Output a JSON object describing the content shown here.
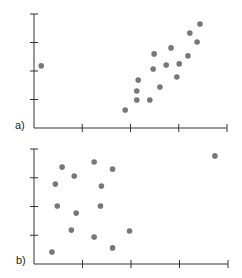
{
  "chart_data": [
    {
      "type": "scatter",
      "panel_label": "a)",
      "title": "",
      "xlabel": "",
      "ylabel": "",
      "xlim": [
        0,
        4
      ],
      "ylim": [
        0,
        4
      ],
      "x_ticks": [
        1,
        2,
        3,
        4
      ],
      "y_ticks": [
        1,
        2,
        3,
        4
      ],
      "tick_labels_shown": false,
      "grid": false,
      "legend": null,
      "point_color": "#777777",
      "points": [
        {
          "x": 0.15,
          "y": 2.18
        },
        {
          "x": 1.89,
          "y": 0.63
        },
        {
          "x": 2.13,
          "y": 0.98
        },
        {
          "x": 2.4,
          "y": 0.98
        },
        {
          "x": 2.13,
          "y": 1.3
        },
        {
          "x": 2.16,
          "y": 1.68
        },
        {
          "x": 2.61,
          "y": 1.44
        },
        {
          "x": 2.47,
          "y": 2.07
        },
        {
          "x": 2.49,
          "y": 2.6
        },
        {
          "x": 2.74,
          "y": 2.21
        },
        {
          "x": 2.84,
          "y": 2.81
        },
        {
          "x": 3.01,
          "y": 2.25
        },
        {
          "x": 2.96,
          "y": 1.79
        },
        {
          "x": 3.19,
          "y": 2.53
        },
        {
          "x": 3.23,
          "y": 3.33
        },
        {
          "x": 3.38,
          "y": 3.02
        },
        {
          "x": 3.44,
          "y": 3.65
        }
      ]
    },
    {
      "type": "scatter",
      "panel_label": "b)",
      "title": "",
      "xlabel": "",
      "ylabel": "",
      "xlim": [
        0,
        4
      ],
      "ylim": [
        0,
        4
      ],
      "x_ticks": [
        1,
        2,
        3,
        4
      ],
      "y_ticks": [
        1,
        2,
        3,
        4
      ],
      "tick_labels_shown": false,
      "grid": false,
      "legend": null,
      "point_color": "#777777",
      "points": [
        {
          "x": 0.37,
          "y": 0.42
        },
        {
          "x": 0.58,
          "y": 3.37
        },
        {
          "x": 0.44,
          "y": 2.78
        },
        {
          "x": 0.48,
          "y": 2.02
        },
        {
          "x": 0.83,
          "y": 3.06
        },
        {
          "x": 0.87,
          "y": 1.77
        },
        {
          "x": 0.77,
          "y": 1.18
        },
        {
          "x": 1.24,
          "y": 3.55
        },
        {
          "x": 1.24,
          "y": 0.94
        },
        {
          "x": 1.37,
          "y": 2.02
        },
        {
          "x": 1.39,
          "y": 2.71
        },
        {
          "x": 1.62,
          "y": 3.3
        },
        {
          "x": 1.62,
          "y": 0.56
        },
        {
          "x": 1.97,
          "y": 1.15
        },
        {
          "x": 3.73,
          "y": 3.76
        }
      ]
    }
  ]
}
